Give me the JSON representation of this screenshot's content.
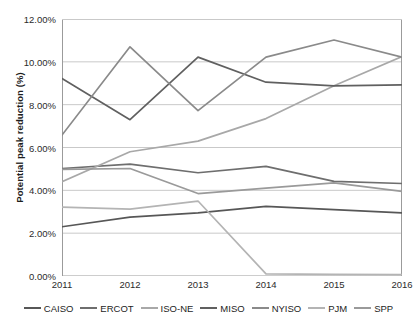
{
  "chart_data": {
    "type": "line",
    "title": "",
    "xlabel": "",
    "ylabel": "Potential peak reduction (%)",
    "x": [
      "2011",
      "2012",
      "2013",
      "2014",
      "2015",
      "2016"
    ],
    "categories": [
      "2011",
      "2012",
      "2013",
      "2014",
      "2015",
      "2016"
    ],
    "ylim": [
      0,
      12
    ],
    "ytick_values": [
      0,
      2,
      4,
      6,
      8,
      10,
      12
    ],
    "ytick_labels": [
      "0.00%",
      "2.00%",
      "4.00%",
      "6.00%",
      "8.00%",
      "10.00%",
      "12.00%"
    ],
    "grid": "horizontal",
    "legend_position": "bottom",
    "value_unit": "percent",
    "series": [
      {
        "name": "CAISO",
        "color": "#575757",
        "values": [
          2.3,
          2.75,
          2.95,
          3.25,
          3.1,
          2.95
        ]
      },
      {
        "name": "ERCOT",
        "color": "#6e6e6e",
        "values": [
          5.02,
          5.22,
          4.82,
          5.12,
          4.42,
          4.32
        ]
      },
      {
        "name": "ISO-NE",
        "color": "#a8a8a8",
        "values": [
          4.4,
          5.8,
          6.3,
          7.35,
          8.88,
          10.25
        ]
      },
      {
        "name": "MISO",
        "color": "#606060",
        "values": [
          9.22,
          7.3,
          10.22,
          9.05,
          8.88,
          8.92
        ]
      },
      {
        "name": "NYISO",
        "color": "#8a8a8a",
        "values": [
          6.58,
          10.7,
          7.72,
          10.22,
          11.02,
          10.22
        ]
      },
      {
        "name": "PJM",
        "color": "#b4b4b4",
        "values": [
          3.22,
          3.12,
          3.5,
          0.1,
          0.08,
          0.06
        ]
      },
      {
        "name": "SPP",
        "color": "#9a9a9a",
        "values": [
          4.98,
          5.02,
          3.85,
          4.1,
          4.35,
          3.95
        ]
      }
    ]
  },
  "axis": {
    "y_title": "Potential peak reduction (%)"
  },
  "legend": {
    "items": [
      {
        "label": "CAISO"
      },
      {
        "label": "ERCOT"
      },
      {
        "label": "ISO-NE"
      },
      {
        "label": "MISO"
      },
      {
        "label": "NYISO"
      },
      {
        "label": "PJM"
      },
      {
        "label": "SPP"
      }
    ]
  },
  "colors": {
    "grid": "#c9c9c9",
    "axis": "#9b9b9b",
    "text": "#2b2b2b",
    "background": "#ffffff"
  }
}
